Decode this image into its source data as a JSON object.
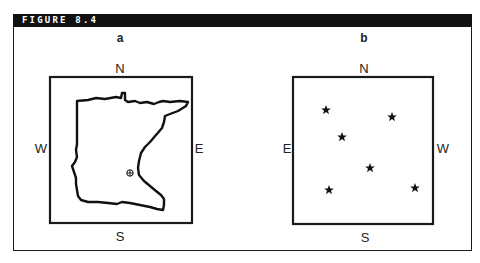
{
  "figure": {
    "title": "FIGURE 8.4"
  },
  "panels": [
    {
      "id": "a",
      "label": "a",
      "directions": {
        "north": "N",
        "south": "S",
        "west": "W",
        "east": "E"
      },
      "content": "state-outline-map",
      "marker": {
        "symbol": "circled-plus",
        "x": 130,
        "y": 173
      },
      "box": {
        "x": 50,
        "y": 77,
        "w": 142,
        "h": 146
      }
    },
    {
      "id": "b",
      "label": "b",
      "directions": {
        "north": "N",
        "south": "S",
        "west": "E",
        "east": "W"
      },
      "content": "star-field",
      "stars": [
        {
          "x": 326,
          "y": 110
        },
        {
          "x": 392,
          "y": 117
        },
        {
          "x": 342,
          "y": 137
        },
        {
          "x": 370,
          "y": 168
        },
        {
          "x": 329,
          "y": 190
        },
        {
          "x": 415,
          "y": 188
        }
      ],
      "box": {
        "x": 293,
        "y": 77,
        "w": 140,
        "h": 147
      }
    }
  ],
  "colors": {
    "ink": "#1a1a1a",
    "header_bg": "#111111",
    "header_text": "#ffffff",
    "background": "#ffffff"
  }
}
